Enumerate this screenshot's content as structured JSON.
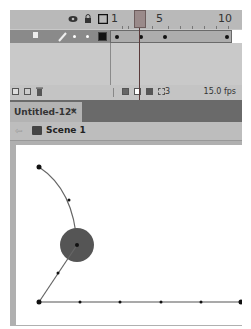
{
  "timeline": {
    "header_icons": [
      "eye-icon",
      "lock-icon",
      "outline-icon"
    ],
    "frame_numbers": {
      "one": "1",
      "five": "5",
      "ten": "10"
    },
    "current_frame": 2,
    "layer": {
      "icons": [
        "layer-icon",
        "pencil-icon",
        "dot-visible",
        "dot-lock",
        "color-swatch"
      ],
      "keyframes": [
        1,
        2,
        5,
        9
      ]
    },
    "toolbar": {
      "icons": [
        "new-layer-icon",
        "new-folder-icon",
        "delete-icon",
        "center-frame-icon",
        "onion-skin-icon",
        "onion-skin-outlines-icon",
        "edit-multiple-frames-icon",
        "modify-markers-icon"
      ],
      "frame_count": "3",
      "fps": "15.0 fps"
    }
  },
  "document_tab": {
    "title": "Untitled-12*",
    "close": "×"
  },
  "scene_bar": {
    "back": "⇦",
    "scene": "Scene 1"
  },
  "stage": {
    "ball_color": "#555555",
    "path_color": "#666666",
    "arc_points": [
      [
        39,
        167
      ],
      [
        69,
        200
      ],
      [
        77,
        245
      ]
    ],
    "line_points": [
      [
        77,
        245
      ],
      [
        58,
        273
      ],
      [
        39,
        302
      ]
    ],
    "ground_dots": [
      39,
      80,
      120,
      161,
      201,
      242
    ]
  }
}
